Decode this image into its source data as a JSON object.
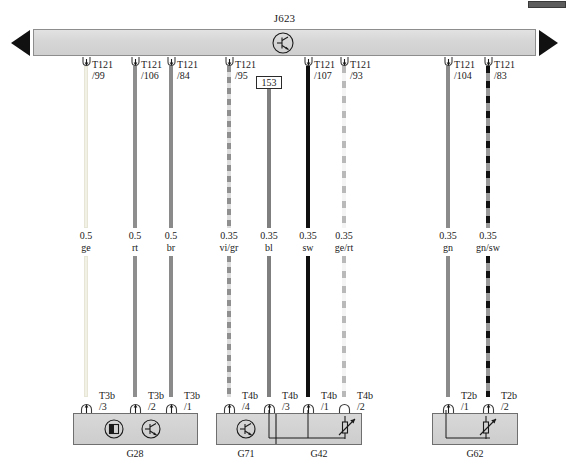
{
  "diagram": {
    "type": "automotive-wiring-diagram",
    "module": {
      "id": "J623",
      "symbol": "transistor-circle-icon",
      "continues_left": true,
      "continues_right": true
    },
    "splice": {
      "id": "153"
    },
    "top_connectors": [
      {
        "name": "T121",
        "pin": "/99"
      },
      {
        "name": "T121",
        "pin": "/106"
      },
      {
        "name": "T121",
        "pin": "/84"
      },
      {
        "name": "T121",
        "pin": "/95"
      },
      {
        "name": "T121",
        "pin": "/107"
      },
      {
        "name": "T121",
        "pin": "/93"
      },
      {
        "name": "T121",
        "pin": "/104"
      },
      {
        "name": "T121",
        "pin": "/83"
      }
    ],
    "wires": [
      {
        "gauge": "0.5",
        "color": "ge",
        "style": "w-ge"
      },
      {
        "gauge": "0.5",
        "color": "rt",
        "style": "w-rt"
      },
      {
        "gauge": "0.5",
        "color": "br",
        "style": "w-br"
      },
      {
        "gauge": "0.35",
        "color": "vi/gr",
        "style": "w-vigr"
      },
      {
        "gauge": "0.35",
        "color": "bl",
        "style": "w-bl"
      },
      {
        "gauge": "0.35",
        "color": "sw",
        "style": "w-sw"
      },
      {
        "gauge": "0.35",
        "color": "ge/rt",
        "style": "w-gert"
      },
      {
        "gauge": "0.35",
        "color": "gn",
        "style": "w-gn"
      },
      {
        "gauge": "0.35",
        "color": "gn/sw",
        "style": "w-gnsw"
      }
    ],
    "bottom_connectors": [
      {
        "name": "T3b",
        "pin": "/3"
      },
      {
        "name": "T3b",
        "pin": "/2"
      },
      {
        "name": "T3b",
        "pin": "/1"
      },
      {
        "name": "T4b",
        "pin": "/4"
      },
      {
        "name": "T4b",
        "pin": "/3"
      },
      {
        "name": "T4b",
        "pin": "/1"
      },
      {
        "name": "T4b",
        "pin": "/2"
      },
      {
        "name": "T2b",
        "pin": "/1"
      },
      {
        "name": "T2b",
        "pin": "/2"
      }
    ],
    "components": [
      {
        "id": "G28",
        "symbols": [
          "half-filled-circle-icon",
          "transistor-circle-icon"
        ]
      },
      {
        "id": "G71",
        "symbols": [
          "transistor-circle-icon"
        ]
      },
      {
        "id": "G42",
        "symbols": [
          "variable-resistor-icon"
        ]
      },
      {
        "id": "G62",
        "symbols": [
          "variable-resistor-icon"
        ]
      }
    ]
  }
}
